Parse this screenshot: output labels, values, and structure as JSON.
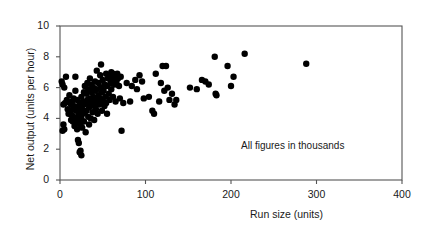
{
  "chart_data": {
    "type": "scatter",
    "title": "",
    "xlabel": "Run size (units)",
    "ylabel": "Net output (units per hour)",
    "annotation": "All figures in thousands",
    "xlim": [
      0,
      400
    ],
    "ylim": [
      0,
      10
    ],
    "xticks": [
      0,
      100,
      200,
      300,
      400
    ],
    "yticks": [
      0,
      2,
      4,
      6,
      8,
      10
    ],
    "grid": false,
    "legend": null,
    "marker": {
      "shape": "circle",
      "color": "#000000",
      "size": 3.2
    },
    "frame": {
      "top": true,
      "right": true,
      "bottom": true,
      "left": true,
      "color": "#555555"
    },
    "points": [
      [
        2,
        6.4
      ],
      [
        3,
        6.2
      ],
      [
        5,
        6.0
      ],
      [
        4,
        4.9
      ],
      [
        6,
        5.0
      ],
      [
        4,
        3.6
      ],
      [
        5,
        3.3
      ],
      [
        3,
        3.2
      ],
      [
        7,
        6.7
      ],
      [
        8,
        5.2
      ],
      [
        9,
        4.6
      ],
      [
        10,
        4.3
      ],
      [
        11,
        5.5
      ],
      [
        12,
        5.0
      ],
      [
        12,
        4.4
      ],
      [
        13,
        3.9
      ],
      [
        13,
        4.9
      ],
      [
        14,
        5.1
      ],
      [
        14,
        4.2
      ],
      [
        15,
        3.8
      ],
      [
        15,
        4.6
      ],
      [
        16,
        5.3
      ],
      [
        16,
        4.0
      ],
      [
        17,
        3.5
      ],
      [
        17,
        4.8
      ],
      [
        18,
        6.7
      ],
      [
        18,
        5.8
      ],
      [
        19,
        4.5
      ],
      [
        19,
        3.7
      ],
      [
        20,
        4.1
      ],
      [
        20,
        5.2
      ],
      [
        20,
        3.3
      ],
      [
        21,
        4.7
      ],
      [
        21,
        2.6
      ],
      [
        22,
        4.4
      ],
      [
        22,
        3.9
      ],
      [
        22,
        2.4
      ],
      [
        23,
        5.0
      ],
      [
        23,
        4.2
      ],
      [
        23,
        1.8
      ],
      [
        24,
        3.6
      ],
      [
        24,
        4.8
      ],
      [
        24,
        1.9
      ],
      [
        25,
        5.4
      ],
      [
        25,
        4.0
      ],
      [
        25,
        1.6
      ],
      [
        26,
        4.6
      ],
      [
        26,
        3.4
      ],
      [
        27,
        5.1
      ],
      [
        27,
        4.3
      ],
      [
        28,
        5.7
      ],
      [
        28,
        4.9
      ],
      [
        28,
        3.8
      ],
      [
        29,
        4.4
      ],
      [
        29,
        6.1
      ],
      [
        30,
        5.0
      ],
      [
        30,
        3.1
      ],
      [
        31,
        5.6
      ],
      [
        31,
        4.5
      ],
      [
        32,
        6.3
      ],
      [
        32,
        5.2
      ],
      [
        33,
        4.1
      ],
      [
        33,
        5.9
      ],
      [
        34,
        4.7
      ],
      [
        34,
        3.6
      ],
      [
        35,
        5.3
      ],
      [
        35,
        6.6
      ],
      [
        36,
        4.9
      ],
      [
        36,
        4.0
      ],
      [
        37,
        5.7
      ],
      [
        37,
        6.2
      ],
      [
        38,
        5.1
      ],
      [
        38,
        4.4
      ],
      [
        39,
        6.0
      ],
      [
        39,
        5.4
      ],
      [
        40,
        4.8
      ],
      [
        40,
        3.9
      ],
      [
        41,
        5.8
      ],
      [
        41,
        6.4
      ],
      [
        42,
        5.2
      ],
      [
        42,
        4.6
      ],
      [
        43,
        7.1
      ],
      [
        43,
        5.9
      ],
      [
        44,
        5.0
      ],
      [
        44,
        4.3
      ],
      [
        45,
        6.3
      ],
      [
        45,
        5.5
      ],
      [
        46,
        4.9
      ],
      [
        47,
        6.8
      ],
      [
        47,
        5.3
      ],
      [
        48,
        7.5
      ],
      [
        48,
        6.0
      ],
      [
        49,
        5.7
      ],
      [
        49,
        4.5
      ],
      [
        50,
        6.5
      ],
      [
        50,
        5.1
      ],
      [
        51,
        5.8
      ],
      [
        52,
        6.2
      ],
      [
        52,
        4.8
      ],
      [
        53,
        5.4
      ],
      [
        54,
        6.9
      ],
      [
        54,
        5.0
      ],
      [
        55,
        6.1
      ],
      [
        55,
        4.3
      ],
      [
        56,
        6.6
      ],
      [
        57,
        5.6
      ],
      [
        58,
        6.8
      ],
      [
        58,
        5.2
      ],
      [
        59,
        6.3
      ],
      [
        60,
        7.0
      ],
      [
        60,
        5.9
      ],
      [
        61,
        6.5
      ],
      [
        62,
        6.9
      ],
      [
        62,
        5.4
      ],
      [
        63,
        6.7
      ],
      [
        64,
        6.2
      ],
      [
        65,
        6.8
      ],
      [
        65,
        5.1
      ],
      [
        66,
        6.4
      ],
      [
        67,
        6.9
      ],
      [
        68,
        6.6
      ],
      [
        69,
        6.1
      ],
      [
        70,
        5.3
      ],
      [
        71,
        6.7
      ],
      [
        72,
        3.2
      ],
      [
        74,
        5.0
      ],
      [
        78,
        6.3
      ],
      [
        82,
        5.1
      ],
      [
        84,
        6.1
      ],
      [
        88,
        6.5
      ],
      [
        90,
        5.9
      ],
      [
        93,
        6.8
      ],
      [
        96,
        6.4
      ],
      [
        98,
        5.3
      ],
      [
        104,
        5.4
      ],
      [
        108,
        4.5
      ],
      [
        110,
        4.3
      ],
      [
        112,
        6.9
      ],
      [
        116,
        5.1
      ],
      [
        118,
        6.3
      ],
      [
        120,
        7.4
      ],
      [
        122,
        5.8
      ],
      [
        124,
        7.4
      ],
      [
        126,
        6.0
      ],
      [
        128,
        5.2
      ],
      [
        131,
        5.6
      ],
      [
        134,
        4.9
      ],
      [
        136,
        5.2
      ],
      [
        152,
        6.0
      ],
      [
        160,
        5.9
      ],
      [
        166,
        6.5
      ],
      [
        170,
        6.4
      ],
      [
        174,
        6.2
      ],
      [
        181,
        8.0
      ],
      [
        182,
        5.6
      ],
      [
        183,
        5.5
      ],
      [
        196,
        7.4
      ],
      [
        200,
        6.1
      ],
      [
        203,
        6.7
      ],
      [
        216,
        8.2
      ],
      [
        288,
        7.55
      ]
    ]
  }
}
